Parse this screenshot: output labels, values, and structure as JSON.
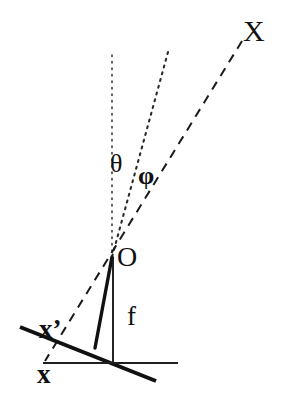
{
  "figure": {
    "background_color": "#ffffff",
    "ink_color": "#111111",
    "width": 290,
    "height": 405
  },
  "labels": {
    "axis_X": "X",
    "angle_theta": "θ",
    "angle_phi": "φ",
    "origin_O": "O",
    "focal_f": "f",
    "axis_x_prime": "x’",
    "axis_x": "x"
  },
  "geometry": {
    "origin_point": {
      "x": 112,
      "y": 257
    },
    "rays": [
      {
        "name": "optical-axis-dotted",
        "style": "dotted",
        "from": {
          "x": 112,
          "y": 55
        },
        "to": {
          "x": 112,
          "y": 257
        }
      },
      {
        "name": "theta-ray-dotted",
        "style": "dotted",
        "from": {
          "x": 168,
          "y": 52
        },
        "to": {
          "x": 112,
          "y": 257
        }
      },
      {
        "name": "object-ray-dashed",
        "style": "dashed",
        "from": {
          "x": 242,
          "y": 41
        },
        "to": {
          "x": 45,
          "y": 361
        }
      }
    ],
    "segments": [
      {
        "name": "focal-perpendicular-thick",
        "style": "solid-thick",
        "from": {
          "x": 112,
          "y": 257
        },
        "to": {
          "x": 95,
          "y": 348
        }
      },
      {
        "name": "focal-length-f-vertical",
        "style": "solid-thin",
        "from": {
          "x": 113,
          "y": 257
        },
        "to": {
          "x": 113,
          "y": 364
        }
      },
      {
        "name": "image-plane-x-prime-thick",
        "style": "solid-thick",
        "from": {
          "x": 20,
          "y": 327
        },
        "to": {
          "x": 156,
          "y": 381
        }
      },
      {
        "name": "image-plane-x-horizontal",
        "style": "solid-thin",
        "from": {
          "x": 43,
          "y": 363
        },
        "to": {
          "x": 178,
          "y": 363
        }
      }
    ]
  }
}
